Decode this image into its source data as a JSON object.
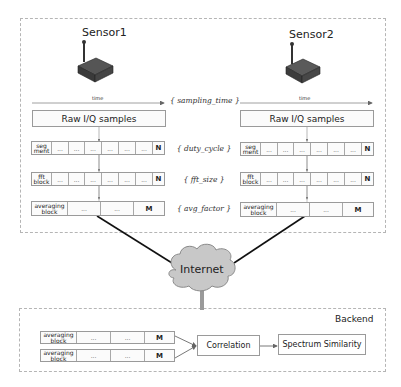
{
  "sensors": [
    {
      "label": "Sensor1",
      "time_label": "time",
      "raw_label": "Raw I/Q samples"
    },
    {
      "label": "Sensor2",
      "time_label": "time",
      "raw_label": "Raw I/Q samples"
    }
  ],
  "params": {
    "sampling_time": "{ sampling_time }",
    "duty_cycle": "{ duty_cycle }",
    "fft_size": "{ fft_size }",
    "avg_factor": "{ avg_factor }"
  },
  "rows": {
    "segment": {
      "head_line1": "seg",
      "head_line2": "ment",
      "cells": [
        "...",
        "...",
        "...",
        "...",
        "...",
        "..."
      ],
      "end": "N"
    },
    "fft": {
      "head_line1": "fft",
      "head_line2": "block",
      "cells": [
        "...",
        "...",
        "...",
        "...",
        "...",
        "..."
      ],
      "end": "N"
    },
    "averaging": {
      "head_line1": "averaging",
      "head_line2": "block",
      "cells": [
        "...",
        "..."
      ],
      "end": "M"
    }
  },
  "internet": {
    "label": "Internet"
  },
  "backend": {
    "title": "Backend",
    "correlation": "Correlation",
    "spectrum_similarity": "Spectrum Similarity"
  }
}
